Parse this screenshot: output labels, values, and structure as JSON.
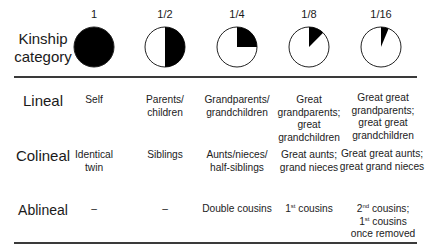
{
  "header": {
    "label": "Kinship\ncategory",
    "label_line1": "Kinship",
    "label_line2": "category",
    "fractions": [
      {
        "label": "1",
        "value": 1.0
      },
      {
        "label": "1/2",
        "value": 0.5
      },
      {
        "label": "1/4",
        "value": 0.25
      },
      {
        "label": "1/8",
        "value": 0.125
      },
      {
        "label": "1/16",
        "value": 0.0625
      }
    ]
  },
  "rows": [
    {
      "category": "Lineal",
      "cells": [
        [
          "Self"
        ],
        [
          "Parents/",
          "children"
        ],
        [
          "Grandparents/",
          "grandchildren"
        ],
        [
          "Great",
          "grandparents;",
          "great",
          "grandchildren"
        ],
        [
          "Great great",
          "grandparents;",
          "great great",
          "grandchildren"
        ]
      ]
    },
    {
      "category": "Colineal",
      "cells": [
        [
          "Identical",
          "twin"
        ],
        [
          "Siblings"
        ],
        [
          "Aunts/nieces/",
          "half-siblings"
        ],
        [
          "Great aunts;",
          "grand nieces"
        ],
        [
          "Great great aunts;",
          "great grand nieces"
        ]
      ]
    },
    {
      "category": "Ablineal",
      "cells": [
        [
          "–"
        ],
        [
          "–"
        ],
        [
          "Double cousins"
        ],
        [
          "1st cousins"
        ],
        [
          "2nd cousins;",
          "1st cousins",
          "once removed"
        ]
      ]
    }
  ],
  "ablineal_display": {
    "c4_num": "1",
    "c4_sup": "st",
    "c4_rest": " cousins",
    "c5_l1_num": "2",
    "c5_l1_sup": "nd",
    "c5_l1_rest": " cousins;",
    "c5_l2_num": "1",
    "c5_l2_sup": "st",
    "c5_l2_rest": " cousins",
    "c5_l3": "once removed"
  },
  "colors": {
    "fill": "#000000",
    "outline": "#222222",
    "background": "#ffffff",
    "rule": "#3a3a3a"
  }
}
